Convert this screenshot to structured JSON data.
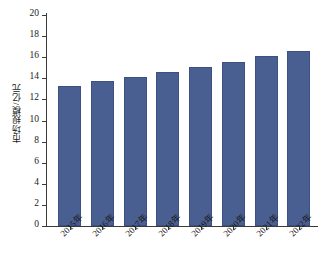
{
  "chart_data": {
    "type": "bar",
    "title": "",
    "xlabel": "",
    "ylabel": "市场规模/亿元",
    "categories": [
      "2015年",
      "2016年",
      "2017年",
      "2018年",
      "2019年",
      "2020年",
      "2021年",
      "2022年"
    ],
    "values": [
      13.3,
      13.7,
      14.1,
      14.6,
      15.1,
      15.5,
      16.1,
      16.6
    ],
    "series": [
      {
        "name": "市场规模",
        "values": [
          13.3,
          13.7,
          14.1,
          14.6,
          15.1,
          15.5,
          16.1,
          16.6
        ]
      }
    ],
    "ylim": [
      0,
      20
    ],
    "ytick_step": 2,
    "yticks": [
      "20",
      "18",
      "16",
      "14",
      "12",
      "10",
      "8",
      "6",
      "4",
      "2",
      "0"
    ],
    "grid": false,
    "legend": false,
    "legend_position": "none",
    "bar_color": "#4a5f91",
    "axis_color": "#3a3a3a",
    "background_color": "#ffffff"
  }
}
